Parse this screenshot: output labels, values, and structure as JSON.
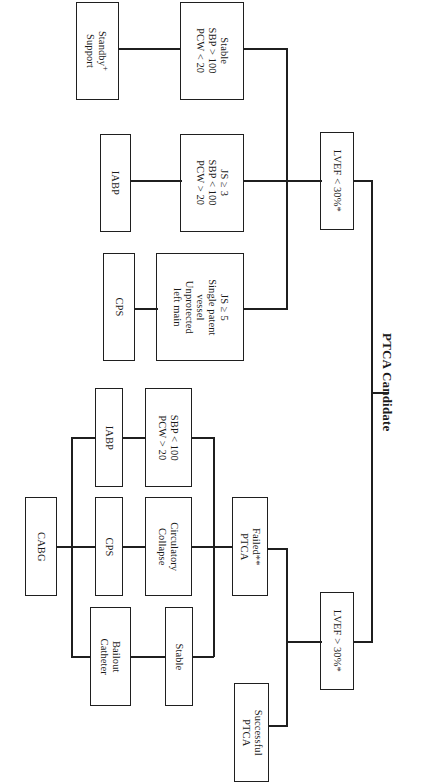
{
  "figure": {
    "title": "PTCA Candidate",
    "caption": "Fig. 12 Algorithm of Rescue Support Modalities during Interventional Procedures",
    "orientation": "rotated-90-ccw"
  },
  "nodes": {
    "root": {
      "label": "PTCA Candidate"
    },
    "lvef_low": {
      "label": "LVEF < 30%*"
    },
    "lvef_high": {
      "label": "LVEF > 30%*"
    },
    "stable_top": {
      "lines": [
        "Stable",
        "SBP > 100",
        "PCW < 20"
      ]
    },
    "standby": {
      "lines": [
        "Standby",
        "Support"
      ],
      "superscript": "+"
    },
    "js3": {
      "lines": [
        "JS ≥ 3",
        "SBP < 100",
        "PCW > 20"
      ]
    },
    "iabp_top": {
      "lines": [
        "IABP"
      ]
    },
    "js5": {
      "lines": [
        "JS ≥ 5",
        "Single patent",
        "vessel",
        "Unprotected",
        "left main"
      ]
    },
    "cps_top": {
      "lines": [
        "CPS"
      ]
    },
    "successful_ptca": {
      "lines": [
        "Successful",
        "PTCA"
      ]
    },
    "failed_ptca": {
      "lines": [
        "Failed**",
        "PTCA"
      ]
    },
    "sbp_low": {
      "lines": [
        "SBP < 100",
        "PCW > 20"
      ]
    },
    "iabp_bot": {
      "lines": [
        "IABP"
      ]
    },
    "circ_collapse": {
      "lines": [
        "Circulatory",
        "Collapse"
      ]
    },
    "cps_bot": {
      "lines": [
        "CPS"
      ]
    },
    "stable_bot": {
      "lines": [
        "Stable"
      ]
    },
    "bailout": {
      "lines": [
        "Bailout",
        "Catheter"
      ]
    },
    "cabg": {
      "lines": [
        "CABG"
      ]
    }
  },
  "style": {
    "box_border": "#1f1f1f",
    "line_color": "#1f1f1f",
    "background": "#ffffff",
    "text_color": "#1a1a1a"
  }
}
